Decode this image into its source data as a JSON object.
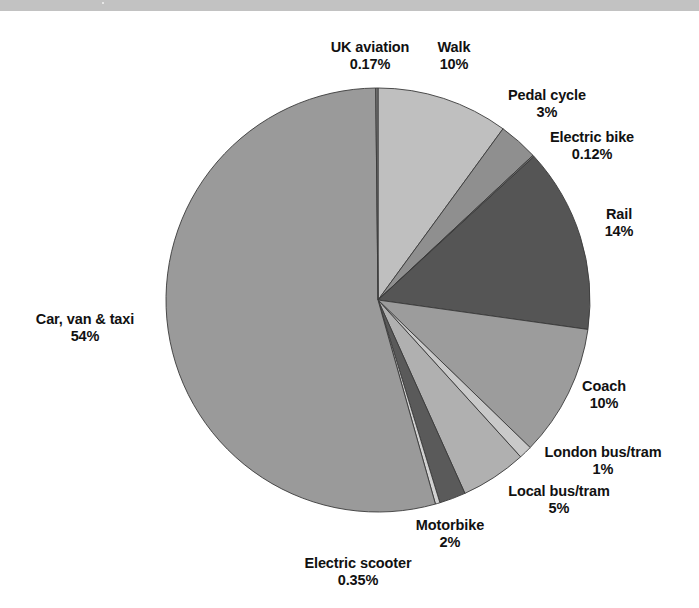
{
  "page": {
    "background_color": "#ffffff",
    "top_bar_color": "#c2c2c2"
  },
  "chart_data": {
    "type": "pie",
    "title": "",
    "subtitle": "",
    "xlabel": "",
    "ylabel": "",
    "legend_position": "none",
    "grid": false,
    "start_angle_deg": 0,
    "direction": "clockwise",
    "center": {
      "x": 378,
      "y": 300
    },
    "radius": 212,
    "labels_show_name_and_percent": true,
    "categories": [
      "Walk",
      "Pedal cycle",
      "Electric bike",
      "Rail",
      "Coach",
      "London bus/tram",
      "Local bus/tram",
      "Motorbike",
      "Electric scooter",
      "Car, van & taxi",
      "UK aviation"
    ],
    "values": [
      10,
      3,
      0.12,
      14,
      10,
      1,
      5,
      2,
      0.35,
      54,
      0.17
    ],
    "value_labels": [
      "10%",
      "3%",
      "0.12%",
      "14%",
      "10%",
      "1%",
      "5%",
      "2%",
      "0.35%",
      "54%",
      "0.17%"
    ],
    "colors": [
      "#bfbfbf",
      "#8f8f8f",
      "#6e6e6e",
      "#555555",
      "#9c9c9c",
      "#c9c9c9",
      "#b0b0b0",
      "#5a5a5a",
      "#d2d2d2",
      "#9a9a9a",
      "#7a7a7a"
    ],
    "slice_border_color": "#3a3a3a",
    "units": "percent of total"
  },
  "slices": [
    {
      "name": "Walk",
      "percent": "10%",
      "color": "#bfbfbf"
    },
    {
      "name": "Pedal cycle",
      "percent": "3%",
      "color": "#8f8f8f"
    },
    {
      "name": "Electric bike",
      "percent": "0.12%",
      "color": "#6e6e6e"
    },
    {
      "name": "Rail",
      "percent": "14%",
      "color": "#555555"
    },
    {
      "name": "Coach",
      "percent": "10%",
      "color": "#9c9c9c"
    },
    {
      "name": "London bus/tram",
      "percent": "1%",
      "color": "#c9c9c9"
    },
    {
      "name": "Local bus/tram",
      "percent": "5%",
      "color": "#b0b0b0"
    },
    {
      "name": "Motorbike",
      "percent": "2%",
      "color": "#5a5a5a"
    },
    {
      "name": "Electric scooter",
      "percent": "0.35%",
      "color": "#d2d2d2"
    },
    {
      "name": "Car, van & taxi",
      "percent": "54%",
      "color": "#9a9a9a"
    },
    {
      "name": "UK aviation",
      "percent": "0.17%",
      "color": "#7a7a7a"
    }
  ]
}
